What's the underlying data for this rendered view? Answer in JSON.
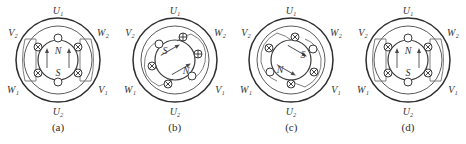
{
  "figure": {
    "background_color": "#ffffff",
    "ink_color": "#2e2e2e",
    "panel_count": 4,
    "stator_labels": {
      "top": "U₁",
      "bottom": "U₂",
      "upper_left": "V₂",
      "upper_right": "W₂",
      "lower_left": "W₁",
      "lower_right": "V₁"
    },
    "panels": [
      {
        "caption": "(a)",
        "rotor_angle_deg": 0,
        "pole_top_label": "N",
        "pole_bottom_label": "S",
        "slot_markers": [
          {
            "position": "top",
            "symbol": "none"
          },
          {
            "position": "upper-right",
            "symbol": "cross"
          },
          {
            "position": "lower-right",
            "symbol": "cross"
          },
          {
            "position": "bottom",
            "symbol": "none"
          },
          {
            "position": "lower-left",
            "symbol": "cross"
          },
          {
            "position": "upper-left",
            "symbol": "cross"
          }
        ],
        "flux_arrows": 2,
        "has_bracket_coils": true,
        "has_rotation_arrows": false
      },
      {
        "caption": "(b)",
        "rotor_angle_deg": 60,
        "pole_top_label": "S",
        "pole_bottom_label": "N",
        "slot_markers": [
          {
            "position": "top",
            "symbol": "plus"
          },
          {
            "position": "upper-right",
            "symbol": "plus"
          },
          {
            "position": "lower-right",
            "symbol": "none"
          },
          {
            "position": "bottom",
            "symbol": "cross"
          },
          {
            "position": "lower-left",
            "symbol": "cross"
          },
          {
            "position": "upper-left",
            "symbol": "none"
          }
        ],
        "flux_arrows": 2,
        "has_bracket_coils": false,
        "has_rotation_arrows": true
      },
      {
        "caption": "(c)",
        "rotor_angle_deg": 120,
        "pole_top_label": "S",
        "pole_bottom_label": "N",
        "slot_markers": [
          {
            "position": "top",
            "symbol": "cross"
          },
          {
            "position": "upper-right",
            "symbol": "none"
          },
          {
            "position": "lower-right",
            "symbol": "cross"
          },
          {
            "position": "bottom",
            "symbol": "cross"
          },
          {
            "position": "lower-left",
            "symbol": "none"
          },
          {
            "position": "upper-left",
            "symbol": "cross"
          }
        ],
        "flux_arrows": 2,
        "has_bracket_coils": false,
        "has_rotation_arrows": true
      },
      {
        "caption": "(d)",
        "rotor_angle_deg": 180,
        "pole_top_label": "N",
        "pole_bottom_label": "S",
        "slot_markers": [
          {
            "position": "top",
            "symbol": "none"
          },
          {
            "position": "upper-right",
            "symbol": "cross"
          },
          {
            "position": "lower-right",
            "symbol": "cross"
          },
          {
            "position": "bottom",
            "symbol": "none"
          },
          {
            "position": "lower-left",
            "symbol": "cross"
          },
          {
            "position": "upper-left",
            "symbol": "cross"
          }
        ],
        "flux_arrows": 2,
        "has_bracket_coils": true,
        "has_rotation_arrows": false
      }
    ]
  }
}
